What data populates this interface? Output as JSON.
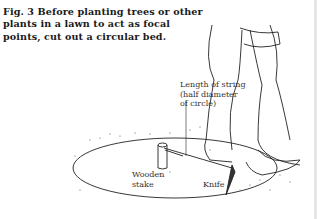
{
  "figure": {
    "caption": "Fig. 3  Before planting trees or other plants in a lawn to act as focal points, cut out a circular bed.",
    "labels": {
      "string": [
        "Length of string",
        "(half diameter",
        "of circle)"
      ],
      "stake": [
        "Wooden",
        "stake"
      ],
      "knife": "Knife"
    }
  }
}
